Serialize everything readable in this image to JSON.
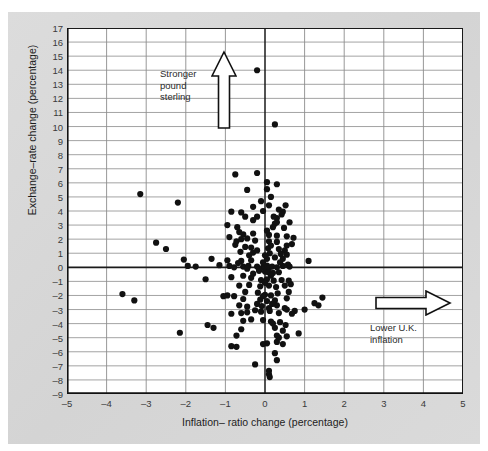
{
  "figure": {
    "background_color": "#d9d9d9",
    "plot_background_color": "#ffffff"
  },
  "annotations": [
    {
      "name": "stronger-pound-sterling",
      "text": "Stronger\npound\nsterling",
      "arrow": "up"
    },
    {
      "name": "lower-uk-inflation",
      "text": "Lower U.K.\ninflation",
      "arrow": "right"
    }
  ],
  "chart_data": {
    "type": "scatter",
    "title": "",
    "xlabel": "Inflation– ratio change (percentage)",
    "ylabel": "Exchange–rate change (percentage)",
    "xlim": [
      -5,
      5
    ],
    "ylim": [
      -9,
      17
    ],
    "xticks": [
      -5,
      -4,
      -3,
      -2,
      -1,
      0,
      1,
      2,
      3,
      4,
      5
    ],
    "xtick_labels": [
      "–5",
      "–4",
      "–3",
      "–2",
      "–1",
      "0",
      "1",
      "2",
      "3",
      "4",
      "5"
    ],
    "yticks": [
      -9,
      -8,
      -7,
      -6,
      -5,
      -4,
      -3,
      -2,
      -1,
      0,
      1,
      2,
      3,
      4,
      5,
      6,
      7,
      8,
      9,
      10,
      11,
      12,
      13,
      14,
      15,
      16,
      17
    ],
    "ytick_labels": [
      "–9",
      "–8",
      "–7",
      "–6",
      "–5",
      "–4",
      "–3",
      "–2",
      "–1",
      "0",
      "1",
      "2",
      "3",
      "4",
      "5",
      "6",
      "7",
      "8",
      "9",
      "10",
      "11",
      "12",
      "13",
      "14",
      "15",
      "16",
      "17"
    ],
    "grid": true,
    "grid_color": "#8c8c8c",
    "zero_lines": {
      "x": 0,
      "y": 0,
      "color": "#1a1a1a"
    },
    "marker_color": "#111111",
    "marker_size": 3.1,
    "legend": null,
    "n_points": 186,
    "points": [
      [
        -0.2,
        14.0
      ],
      [
        0.25,
        10.15
      ],
      [
        -0.75,
        6.6
      ],
      [
        -0.2,
        6.7
      ],
      [
        0.05,
        6.05
      ],
      [
        0.3,
        5.9
      ],
      [
        -3.15,
        5.2
      ],
      [
        -0.45,
        5.5
      ],
      [
        0.15,
        5.0
      ],
      [
        -0.1,
        4.7
      ],
      [
        -2.2,
        4.6
      ],
      [
        0.1,
        4.4
      ],
      [
        -0.3,
        4.3
      ],
      [
        -0.85,
        3.95
      ],
      [
        -0.6,
        3.9
      ],
      [
        -0.05,
        4.0
      ],
      [
        0.35,
        4.1
      ],
      [
        0.45,
        3.95
      ],
      [
        0.42,
        3.75
      ],
      [
        -0.5,
        3.6
      ],
      [
        -0.2,
        3.6
      ],
      [
        0.3,
        3.5
      ],
      [
        0.62,
        3.2
      ],
      [
        0.3,
        3.2
      ],
      [
        0.25,
        3.1
      ],
      [
        -0.95,
        3.0
      ],
      [
        -0.7,
        2.85
      ],
      [
        0.2,
        2.85
      ],
      [
        0.48,
        2.8
      ],
      [
        -0.65,
        2.5
      ],
      [
        -0.55,
        2.35
      ],
      [
        -0.3,
        2.4
      ],
      [
        0.1,
        2.3
      ],
      [
        0.3,
        2.25
      ],
      [
        0.55,
        2.2
      ],
      [
        -2.75,
        1.75
      ],
      [
        -0.6,
        2.0
      ],
      [
        -0.45,
        2.05
      ],
      [
        -0.25,
        1.9
      ],
      [
        0.1,
        1.85
      ],
      [
        0.3,
        1.8
      ],
      [
        0.55,
        1.55
      ],
      [
        -2.5,
        1.3
      ],
      [
        -0.75,
        1.6
      ],
      [
        -0.5,
        1.45
      ],
      [
        -0.35,
        1.4
      ],
      [
        0.08,
        1.35
      ],
      [
        0.35,
        1.3
      ],
      [
        0.5,
        1.2
      ],
      [
        -0.62,
        1.1
      ],
      [
        -0.3,
        1.05
      ],
      [
        0.12,
        1.0
      ],
      [
        0.4,
        0.95
      ],
      [
        0.55,
        0.9
      ],
      [
        -2.05,
        0.55
      ],
      [
        -1.35,
        0.6
      ],
      [
        -0.95,
        0.5
      ],
      [
        -0.6,
        0.45
      ],
      [
        -0.35,
        0.5
      ],
      [
        0.05,
        0.6
      ],
      [
        0.25,
        0.7
      ],
      [
        0.45,
        0.6
      ],
      [
        1.1,
        0.45
      ],
      [
        -1.95,
        0.1
      ],
      [
        -1.75,
        0.05
      ],
      [
        -1.15,
        0.15
      ],
      [
        -0.9,
        0.1
      ],
      [
        -0.78,
        0.0
      ],
      [
        -0.55,
        0.05
      ],
      [
        -0.42,
        0.1
      ],
      [
        -0.2,
        0.05
      ],
      [
        -0.05,
        0.0
      ],
      [
        0.05,
        0.12
      ],
      [
        0.1,
        -0.05
      ],
      [
        0.18,
        0.05
      ],
      [
        0.3,
        0.0
      ],
      [
        0.45,
        0.1
      ],
      [
        0.62,
        0.05
      ],
      [
        -0.15,
        -0.25
      ],
      [
        0.0,
        -0.3
      ],
      [
        0.08,
        -0.35
      ],
      [
        0.2,
        -0.4
      ],
      [
        0.35,
        -0.35
      ],
      [
        -1.5,
        -0.85
      ],
      [
        -0.85,
        -0.7
      ],
      [
        -0.55,
        -0.6
      ],
      [
        -0.35,
        -0.75
      ],
      [
        -0.1,
        -0.9
      ],
      [
        0.05,
        -0.85
      ],
      [
        0.22,
        -0.95
      ],
      [
        0.42,
        -0.9
      ],
      [
        0.6,
        -0.95
      ],
      [
        -0.65,
        -1.3
      ],
      [
        -0.4,
        -1.25
      ],
      [
        -0.12,
        -1.35
      ],
      [
        0.1,
        -1.3
      ],
      [
        0.28,
        -1.4
      ],
      [
        0.5,
        -1.3
      ],
      [
        0.65,
        -1.2
      ],
      [
        -3.6,
        -1.9
      ],
      [
        -0.95,
        -2.0
      ],
      [
        -0.78,
        -2.05
      ],
      [
        -0.5,
        -1.75
      ],
      [
        -0.18,
        -1.8
      ],
      [
        0.0,
        -1.95
      ],
      [
        0.15,
        -2.0
      ],
      [
        0.32,
        -1.85
      ],
      [
        0.55,
        -2.2
      ],
      [
        -3.3,
        -2.35
      ],
      [
        -0.12,
        -2.3
      ],
      [
        0.05,
        -2.4
      ],
      [
        0.25,
        -2.35
      ],
      [
        1.45,
        -2.15
      ],
      [
        1.25,
        -2.55
      ],
      [
        -0.65,
        -2.7
      ],
      [
        -0.45,
        -2.8
      ],
      [
        -0.2,
        -2.6
      ],
      [
        -0.08,
        -2.75
      ],
      [
        0.1,
        -2.9
      ],
      [
        0.3,
        -2.7
      ],
      [
        0.5,
        -2.9
      ],
      [
        1.35,
        -2.7
      ],
      [
        -0.85,
        -3.3
      ],
      [
        -0.6,
        -3.25
      ],
      [
        -0.45,
        -3.2
      ],
      [
        -0.25,
        -3.05
      ],
      [
        -0.1,
        -3.15
      ],
      [
        0.12,
        -3.1
      ],
      [
        0.35,
        -3.25
      ],
      [
        0.55,
        -3.0
      ],
      [
        0.75,
        -3.1
      ],
      [
        1.0,
        -3.0
      ],
      [
        -1.45,
        -4.1
      ],
      [
        -1.3,
        -4.3
      ],
      [
        -0.55,
        -3.8
      ],
      [
        -0.35,
        -3.7
      ],
      [
        -0.05,
        -3.75
      ],
      [
        0.15,
        -3.85
      ],
      [
        0.38,
        -3.9
      ],
      [
        0.52,
        -4.1
      ],
      [
        -0.6,
        -4.4
      ],
      [
        0.25,
        -4.3
      ],
      [
        0.45,
        -4.5
      ],
      [
        -2.15,
        -4.65
      ],
      [
        -0.72,
        -4.85
      ],
      [
        0.3,
        -4.85
      ],
      [
        0.55,
        -4.9
      ],
      [
        0.85,
        -4.7
      ],
      [
        -0.85,
        -5.6
      ],
      [
        -0.72,
        -5.65
      ],
      [
        0.05,
        -5.4
      ],
      [
        -0.05,
        -5.45
      ],
      [
        0.3,
        -5.3
      ],
      [
        0.45,
        -5.45
      ],
      [
        0.25,
        -6.1
      ],
      [
        -0.25,
        -6.9
      ],
      [
        0.3,
        -6.6
      ],
      [
        0.1,
        -7.35
      ],
      [
        0.1,
        -7.6
      ],
      [
        0.12,
        -7.8
      ],
      [
        -0.3,
        3.35
      ],
      [
        0.05,
        2.6
      ],
      [
        -0.4,
        0.85
      ],
      [
        0.72,
        2.1
      ],
      [
        0.68,
        1.65
      ],
      [
        0.15,
        1.55
      ],
      [
        -0.2,
        1.2
      ],
      [
        0.0,
        0.85
      ],
      [
        -1.05,
        -2.05
      ],
      [
        0.0,
        -1.1
      ],
      [
        -0.3,
        -0.45
      ],
      [
        0.15,
        -0.6
      ],
      [
        -0.05,
        0.35
      ],
      [
        0.38,
        0.35
      ],
      [
        -0.05,
        -2.05
      ],
      [
        0.18,
        -2.6
      ],
      [
        -0.55,
        -2.25
      ],
      [
        0.6,
        -1.75
      ],
      [
        0.68,
        -3.3
      ],
      [
        0.2,
        -4.0
      ],
      [
        -0.15,
        -0.15
      ],
      [
        0.05,
        5.55
      ],
      [
        -0.9,
        2.15
      ],
      [
        -0.72,
        1.85
      ],
      [
        0.58,
        0.2
      ],
      [
        -0.45,
        -0.1
      ],
      [
        0.52,
        4.4
      ],
      [
        0.22,
        3.6
      ],
      [
        -0.68,
        0.3
      ],
      [
        0.35,
        -5.0
      ]
    ]
  }
}
